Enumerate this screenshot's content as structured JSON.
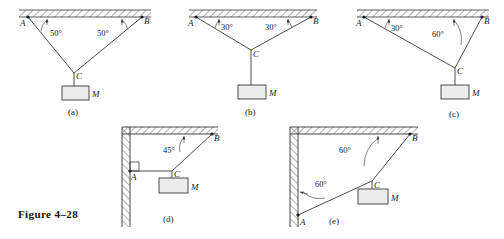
{
  "figure": {
    "caption": "Figure 4–28",
    "background_color": "#ffffff",
    "line_color": "#3a3a3a",
    "block_fill": "#ececed"
  },
  "panels": [
    {
      "id": "a",
      "label": "(a)",
      "support": "ceiling",
      "points": {
        "A": "A",
        "B": "B",
        "C": "C"
      },
      "mass_label": "M",
      "angles": [
        {
          "value": "50°",
          "at": "A",
          "measured_from": "ceiling"
        },
        {
          "value": "50°",
          "at": "B",
          "measured_from": "ceiling"
        }
      ]
    },
    {
      "id": "b",
      "label": "(b)",
      "support": "ceiling",
      "points": {
        "A": "A",
        "B": "B",
        "C": "C"
      },
      "mass_label": "M",
      "angles": [
        {
          "value": "30°",
          "at": "A",
          "measured_from": "ceiling"
        },
        {
          "value": "30°",
          "at": "B",
          "measured_from": "ceiling"
        }
      ]
    },
    {
      "id": "c",
      "label": "(c)",
      "support": "ceiling",
      "points": {
        "A": "A",
        "B": "B",
        "C": "C"
      },
      "mass_label": "M",
      "angles": [
        {
          "value": "30°",
          "at": "A",
          "measured_from": "ceiling"
        },
        {
          "value": "60°",
          "at": "B",
          "measured_from": "ceiling"
        }
      ]
    },
    {
      "id": "d",
      "label": "(d)",
      "support": "wall-and-ceiling",
      "points": {
        "A": "A",
        "B": "B",
        "C": "C"
      },
      "mass_label": "M",
      "angles": [
        {
          "value": "45°",
          "at": "B",
          "measured_from": "ceiling"
        }
      ],
      "right_angle_marker_at": "A"
    },
    {
      "id": "e",
      "label": "(e)",
      "support": "wall-and-ceiling",
      "points": {
        "A": "A",
        "B": "B",
        "C": "C"
      },
      "mass_label": "M",
      "angles": [
        {
          "value": "60°",
          "at": "B",
          "measured_from": "ceiling"
        },
        {
          "value": "60°",
          "at": "A",
          "measured_from": "wall"
        }
      ]
    }
  ]
}
